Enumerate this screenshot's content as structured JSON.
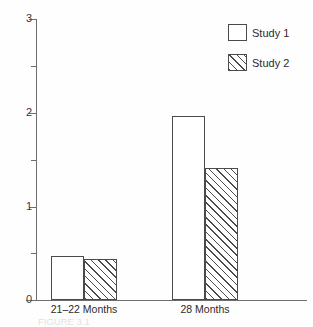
{
  "chart_data": {
    "type": "bar",
    "title": "",
    "xlabel": "",
    "ylabel": "",
    "categories": [
      "21–22 Months",
      "28 Months"
    ],
    "series": [
      {
        "name": "Study 1",
        "values": [
          0.47,
          1.96
        ],
        "fill": "white",
        "pattern": "none"
      },
      {
        "name": "Study 2",
        "values": [
          0.44,
          1.41
        ],
        "fill": "white",
        "pattern": "diagonal-hatch"
      }
    ],
    "ylim": [
      0,
      3
    ],
    "ymajor_ticks": [
      0,
      1,
      2,
      3
    ],
    "yminor_ticks": [
      0.5,
      1.5,
      2.5
    ],
    "ytick_labels": [
      "0",
      "1",
      "2",
      "3"
    ],
    "grid": false,
    "legend_position": "top-right",
    "legend_entries": [
      "Study 1",
      "Study 2"
    ],
    "annotations": []
  },
  "axes": {
    "y_labels": [
      {
        "value": "3",
        "v": 3
      },
      {
        "value": "2",
        "v": 2
      },
      {
        "value": "1",
        "v": 1
      },
      {
        "value": "0",
        "v": 0
      }
    ],
    "x_labels": [
      {
        "text": "21–22 Months"
      },
      {
        "text": "28 Months"
      }
    ]
  },
  "legend": {
    "items": [
      {
        "label": "Study 1",
        "pattern": "none"
      },
      {
        "label": "Study 2",
        "pattern": "diagonal-hatch"
      }
    ]
  },
  "caption": {
    "text": "FIGURE 3.1"
  }
}
